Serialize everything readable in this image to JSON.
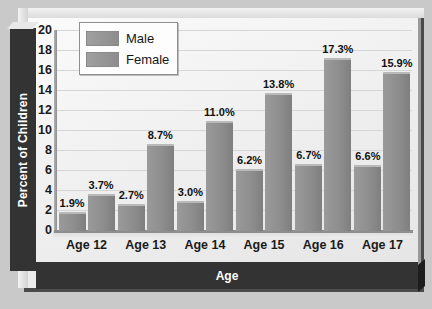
{
  "chart_data": {
    "type": "bar",
    "title": "",
    "xlabel": "Age",
    "ylabel": "Percent of Children",
    "categories": [
      "Age 12",
      "Age 13",
      "Age 14",
      "Age 15",
      "Age 16",
      "Age 17"
    ],
    "series": [
      {
        "name": "Male",
        "values": [
          1.9,
          2.7,
          3.0,
          6.2,
          6.7,
          6.6
        ],
        "color": "#8e8e8e"
      },
      {
        "name": "Female",
        "values": [
          3.7,
          8.7,
          11.0,
          13.8,
          17.3,
          15.9
        ],
        "color": "#8e8e8e"
      }
    ],
    "data_labels": [
      "1.9%",
      "3.7%",
      "2.7%",
      "8.7%",
      "3.0%",
      "11.0%",
      "6.2%",
      "13.8%",
      "6.7%",
      "17.3%",
      "6.6%",
      "15.9%"
    ],
    "ylim": [
      0,
      20
    ],
    "yticks": [
      0,
      2,
      4,
      6,
      8,
      10,
      12,
      14,
      16,
      18,
      20
    ],
    "ytick_labels": [
      "0",
      "2",
      "4",
      "6",
      "8",
      "10",
      "12",
      "14",
      "16",
      "18",
      "20"
    ],
    "grid": true,
    "legend_position": "top-left"
  },
  "legend": {
    "items": [
      {
        "label": "Male"
      },
      {
        "label": "Female"
      }
    ]
  },
  "axes": {
    "y_title": "Percent of Children",
    "x_title": "Age"
  },
  "colors": {
    "bar_fill": "#8e8e8e",
    "band_dark": "#333333",
    "panel_bg": "#efefef",
    "page_bg": "#c9c9c9",
    "gridline": "#d6d6d6"
  }
}
